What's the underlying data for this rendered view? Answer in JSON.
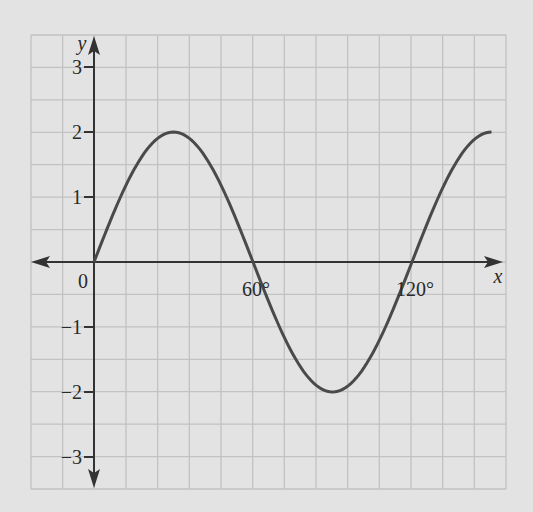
{
  "chart_data": {
    "type": "line",
    "title": "",
    "xlabel": "x",
    "ylabel": "y",
    "function": "y = 2 sin(3x)",
    "x_unit": "degrees",
    "xlim": [
      -20,
      155
    ],
    "ylim": [
      -3.5,
      3.5
    ],
    "grid": true,
    "legend": null,
    "x_tick_labels": [
      {
        "value": 0,
        "label": "0"
      },
      {
        "value": 60,
        "label": "60°"
      },
      {
        "value": 120,
        "label": "120°"
      }
    ],
    "y_tick_labels": [
      {
        "value": 3,
        "label": "3"
      },
      {
        "value": 2,
        "label": "2"
      },
      {
        "value": 1,
        "label": "1"
      },
      {
        "value": -1,
        "label": "−1"
      },
      {
        "value": -2,
        "label": "−2"
      },
      {
        "value": -3,
        "label": "−3"
      }
    ],
    "series": [
      {
        "name": "curve",
        "x": [
          0,
          15,
          30,
          45,
          60,
          75,
          90,
          105,
          120,
          135,
          150
        ],
        "y": [
          0,
          1.41,
          2,
          1.41,
          0,
          -1.41,
          -2,
          -1.41,
          0,
          1.41,
          2
        ]
      }
    ],
    "colors": {
      "background": "#e3e3e3",
      "grid": "#c2c2c2",
      "axis": "#333333",
      "curve": "#4a4a4a"
    }
  }
}
